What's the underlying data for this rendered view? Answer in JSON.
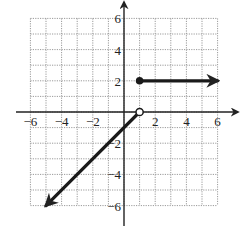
{
  "chart_data": {
    "type": "line",
    "title": "",
    "xlabel": "",
    "ylabel": "",
    "xlim": [
      -6,
      6
    ],
    "ylim": [
      -6,
      6
    ],
    "grid": true,
    "grid_step": 1,
    "x_ticks": [
      -6,
      -4,
      -2,
      2,
      4,
      6
    ],
    "y_ticks": [
      6,
      4,
      2,
      -2,
      -4,
      -6
    ],
    "x_tick_labels": [
      "−6",
      "−4",
      "−2",
      "2",
      "4",
      "6"
    ],
    "y_tick_labels": [
      "6",
      "4",
      "2",
      "−2",
      "−4",
      "−6"
    ],
    "series": [
      {
        "name": "piece-1",
        "description": "y = x - 1 for x < 1",
        "points": [
          [
            1,
            0
          ],
          [
            -5,
            -6
          ]
        ],
        "start_marker": "open",
        "end_marker": "arrow"
      },
      {
        "name": "piece-2",
        "description": "y = 2 for x >= 1",
        "points": [
          [
            1,
            2
          ],
          [
            6,
            2
          ]
        ],
        "start_marker": "closed",
        "end_marker": "arrow"
      }
    ],
    "colors": {
      "line": "#1a1a1a",
      "grid": "#9a9a9a",
      "axis": "#222222",
      "background": "#ffffff"
    }
  }
}
